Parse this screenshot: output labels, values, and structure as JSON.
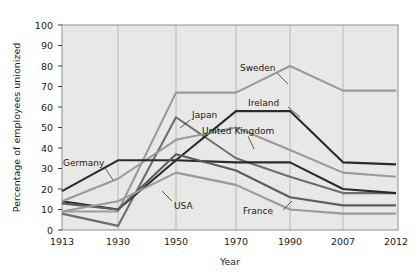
{
  "chart_data": {
    "type": "line",
    "title": "",
    "xlabel": "Year",
    "ylabel": "Percentage of employees unionized",
    "x": [
      "1913",
      "1930",
      "1950",
      "1970",
      "1990",
      "2007",
      "2012"
    ],
    "xticklabels": [
      "1913",
      "1930",
      "1950",
      "1970",
      "1990",
      "2007",
      "2012"
    ],
    "yticklabels": [
      "0",
      "10",
      "20",
      "30",
      "40",
      "50",
      "60",
      "70",
      "80",
      "90",
      "100"
    ],
    "ylim": [
      0,
      100
    ],
    "ytick_step": 10,
    "grid": "vertical",
    "legend": "inline-annotations",
    "series": [
      {
        "name": "Sweden",
        "color": "#9a9a98",
        "values": [
          9,
          9,
          67,
          67,
          80,
          68,
          68
        ],
        "label_x": 1990,
        "label_text": "Sweden"
      },
      {
        "name": "Japan",
        "color": "#6e6e6c",
        "values": [
          8,
          2,
          55,
          35,
          26,
          18,
          18
        ],
        "label_x": 1950,
        "label_text": "Japan"
      },
      {
        "name": "Ireland",
        "color": "#2b2b2b",
        "values": [
          14,
          10,
          34,
          58,
          58,
          33,
          32
        ],
        "label_x": 1970,
        "label_text": "Ireland"
      },
      {
        "name": "United Kingdom",
        "color": "#9a9a98",
        "values": [
          14,
          25,
          44,
          50,
          39,
          28,
          26
        ],
        "label_x": 1970,
        "label_text": "United Kingdom"
      },
      {
        "name": "Germany",
        "color": "#2b2b2b",
        "values": [
          19,
          34,
          34,
          33,
          33,
          20,
          18
        ],
        "label_x": 1930,
        "label_text": "Germany"
      },
      {
        "name": "USA",
        "color": "#5c5c5a",
        "values": [
          13,
          10,
          37,
          29,
          16,
          12,
          12
        ],
        "label_x": 1950,
        "label_text": "USA"
      },
      {
        "name": "France",
        "color": "#9a9a98",
        "values": [
          9,
          14,
          28,
          22,
          10,
          8,
          8
        ],
        "label_x": 1990,
        "label_text": "France"
      }
    ]
  },
  "annotations": {
    "sweden": "Sweden",
    "japan": "Japan",
    "ireland": "Ireland",
    "united_kingdom": "United Kingdom",
    "germany": "Germany",
    "usa": "USA",
    "france": "France"
  },
  "axis": {
    "x_title": "Year",
    "y_title": "Percentage of employees unionized",
    "y_0": "0",
    "y_10": "10",
    "y_20": "20",
    "y_30": "30",
    "y_40": "40",
    "y_50": "50",
    "y_60": "60",
    "y_70": "70",
    "y_80": "80",
    "y_90": "90",
    "y_100": "100",
    "x_1913": "1913",
    "x_1930": "1930",
    "x_1950": "1950",
    "x_1970": "1970",
    "x_1990": "1990",
    "x_2007": "2007",
    "x_2012": "2012"
  },
  "colors": {
    "plot_background": "#e8e8e6",
    "gridline": "#b9b9b7",
    "border": "#8e8e8c",
    "text": "#1a1a1a",
    "dark_series": "#2b2b2b",
    "mid_series": "#6e6e6c",
    "light_series": "#9a9a98"
  }
}
